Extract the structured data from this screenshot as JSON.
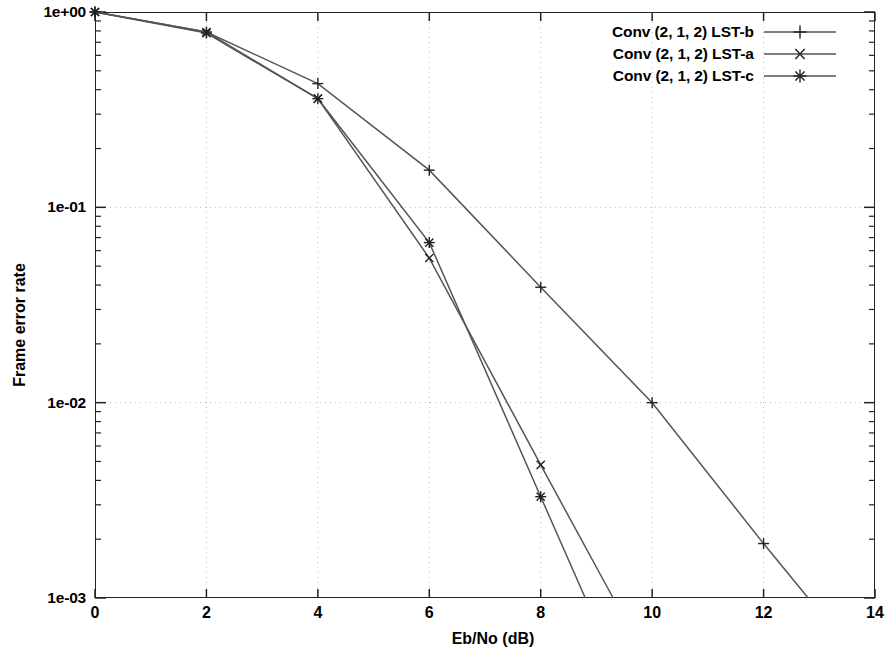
{
  "chart_data": {
    "type": "line",
    "title": "",
    "xlabel": "Eb/No (dB)",
    "ylabel": "Frame error rate",
    "xlim": [
      0,
      14
    ],
    "ylim": [
      0.001,
      1
    ],
    "yscale": "log",
    "grid": true,
    "legend_position": "top-right",
    "xticks": [
      "0",
      "2",
      "4",
      "6",
      "8",
      "10",
      "12",
      "14"
    ],
    "xtick_values": [
      0,
      2,
      4,
      6,
      8,
      10,
      12,
      14
    ],
    "yticks": [
      "1e+00",
      "1e-01",
      "1e-02",
      "1e-03"
    ],
    "ytick_values": [
      1,
      0.1,
      0.01,
      0.001
    ],
    "series": [
      {
        "name": "Conv (2, 1, 2) LST-b",
        "marker": "plus",
        "x": [
          0,
          2,
          4,
          6,
          8,
          10,
          12,
          12.8
        ],
        "y": [
          1.0,
          0.79,
          0.43,
          0.155,
          0.039,
          0.01,
          0.0019,
          0.001
        ]
      },
      {
        "name": "Conv (2, 1, 2) LST-a",
        "marker": "cross",
        "x": [
          0,
          2,
          4,
          6,
          8,
          9.3
        ],
        "y": [
          1.0,
          0.79,
          0.36,
          0.055,
          0.0048,
          0.001
        ]
      },
      {
        "name": "Conv (2, 1, 2) LST-c",
        "marker": "asterisk",
        "x": [
          0,
          2,
          4,
          6,
          8,
          8.8
        ],
        "y": [
          1.0,
          0.78,
          0.36,
          0.066,
          0.0033,
          0.001
        ]
      }
    ],
    "line_color": "#555555",
    "axis_color": "#222222",
    "grid_color": "#bbbbbb"
  }
}
